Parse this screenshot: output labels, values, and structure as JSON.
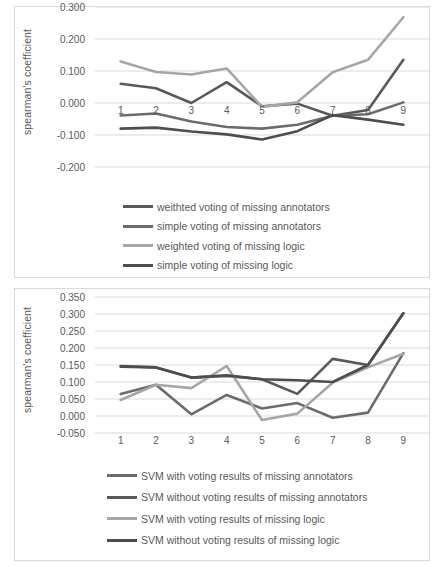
{
  "chart_data": [
    {
      "type": "line",
      "title": "",
      "xlabel": "",
      "ylabel": "spearman's coefficient",
      "x": [
        1,
        2,
        3,
        4,
        5,
        6,
        7,
        8,
        9
      ],
      "xticklabels": [
        "1",
        "2",
        "3",
        "4",
        "5",
        "6",
        "7",
        "8",
        "9"
      ],
      "yticklabels": [
        "0.300",
        "0.200",
        "0.100",
        "0.000",
        "-0.100",
        "-0.200"
      ],
      "ytickvalues": [
        0.3,
        0.2,
        0.1,
        0.0,
        -0.1,
        -0.2
      ],
      "ylim": [
        -0.2,
        0.3
      ],
      "grid": true,
      "legend_position": "below",
      "series": [
        {
          "name": "weithted voting of missing annotators",
          "color": "#595959",
          "values": [
            0.06,
            0.046,
            0.0,
            0.065,
            -0.01,
            -0.002,
            -0.04,
            -0.022,
            0.135
          ]
        },
        {
          "name": "simple voting of missing annotators",
          "color": "#6b6b6b",
          "values": [
            -0.039,
            -0.033,
            -0.058,
            -0.075,
            -0.08,
            -0.068,
            -0.04,
            -0.035,
            0.002
          ]
        },
        {
          "name": "weighted voting of missing logic",
          "color": "#a6a6a6",
          "values": [
            0.13,
            0.097,
            0.089,
            0.108,
            -0.012,
            0.002,
            0.096,
            0.135,
            0.268
          ]
        },
        {
          "name": "simple voting of missing logic",
          "color": "#4d4d4d",
          "values": [
            -0.08,
            -0.077,
            -0.089,
            -0.098,
            -0.114,
            -0.088,
            -0.038,
            -0.052,
            -0.068
          ]
        }
      ]
    },
    {
      "type": "line",
      "title": "",
      "xlabel": "",
      "ylabel": "spearman's coefficient",
      "x": [
        1,
        2,
        3,
        4,
        5,
        6,
        7,
        8,
        9
      ],
      "xticklabels": [
        "1",
        "2",
        "3",
        "4",
        "5",
        "6",
        "7",
        "8",
        "9"
      ],
      "yticklabels": [
        "0.350",
        "0.300",
        "0.250",
        "0.200",
        "0.150",
        "0.100",
        "0.050",
        "0.000",
        "-0.050"
      ],
      "ytickvalues": [
        0.35,
        0.3,
        0.25,
        0.2,
        0.15,
        0.1,
        0.05,
        0.0,
        -0.05
      ],
      "ylim": [
        -0.05,
        0.35
      ],
      "grid": true,
      "legend_position": "below",
      "series": [
        {
          "name": "SVM with voting results of missing annotators",
          "color": "#6b6b6b",
          "values": [
            0.065,
            0.092,
            0.005,
            0.062,
            0.022,
            0.038,
            -0.005,
            0.01,
            0.185
          ]
        },
        {
          "name": "SVM without voting results of missing annotators",
          "color": "#595959",
          "values": [
            0.147,
            0.143,
            0.113,
            0.118,
            0.108,
            0.065,
            0.168,
            0.15,
            0.302
          ]
        },
        {
          "name": "SVM with voting results of missing logic",
          "color": "#a6a6a6",
          "values": [
            0.047,
            0.092,
            0.082,
            0.147,
            -0.012,
            0.007,
            0.098,
            0.143,
            0.183
          ]
        },
        {
          "name": "SVM without voting results of missing logic",
          "color": "#4d4d4d",
          "values": [
            0.145,
            0.143,
            0.113,
            0.12,
            0.108,
            0.105,
            0.1,
            0.15,
            0.302
          ]
        }
      ]
    }
  ],
  "panel1": {
    "ylabel": "spearman's coefficient",
    "yticks": [
      "0.300",
      "0.200",
      "0.100",
      "0.000",
      "-0.100",
      "-0.200"
    ],
    "xticks": [
      "1",
      "2",
      "3",
      "4",
      "5",
      "6",
      "7",
      "8",
      "9"
    ],
    "legend": [
      "weithted voting of missing annotators",
      "simple voting of missing annotators",
      "weighted voting of missing logic",
      "simple voting of missing logic"
    ]
  },
  "panel2": {
    "ylabel": "spearman's coefficient",
    "yticks": [
      "0.350",
      "0.300",
      "0.250",
      "0.200",
      "0.150",
      "0.100",
      "0.050",
      "0.000",
      "-0.050"
    ],
    "xticks": [
      "1",
      "2",
      "3",
      "4",
      "5",
      "6",
      "7",
      "8",
      "9"
    ],
    "legend": [
      "SVM with voting results of missing annotators",
      "SVM without voting results of missing annotators",
      "SVM with voting results of missing logic",
      "SVM without voting results of missing logic"
    ]
  },
  "colors": {
    "grid": "#d9d9d9",
    "text": "#595959",
    "panel_border": "#d9d9d9",
    "series_dark": "#595959",
    "series_mid": "#6b6b6b",
    "series_light": "#a6a6a6",
    "series_darkest": "#4d4d4d"
  }
}
